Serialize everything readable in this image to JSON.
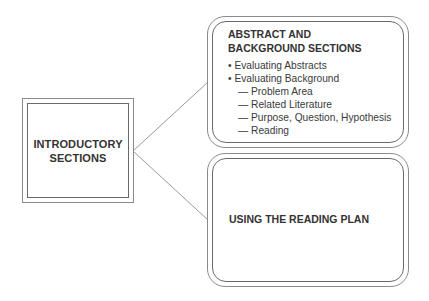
{
  "diagram": {
    "root": {
      "label_line1": "INTRODUCTORY",
      "label_line2": "SECTIONS"
    },
    "branches": [
      {
        "title_line1": "ABSTRACT AND",
        "title_line2": "BACKGROUND SECTIONS",
        "items": [
          {
            "marker": "•",
            "text": "Evaluating Abstracts",
            "level": 1
          },
          {
            "marker": "•",
            "text": "Evaluating Background",
            "level": 1
          },
          {
            "marker": "—",
            "text": "Problem Area",
            "level": 2
          },
          {
            "marker": "—",
            "text": "Related Literature",
            "level": 2
          },
          {
            "marker": "—",
            "text": "Purpose, Question, Hypothesis",
            "level": 2
          },
          {
            "marker": "—",
            "text": "Reading",
            "level": 2
          }
        ]
      },
      {
        "title": "USING THE READING PLAN"
      }
    ],
    "colors": {
      "stroke": "#8a8a8a",
      "text": "#333333",
      "background": "#ffffff"
    }
  }
}
